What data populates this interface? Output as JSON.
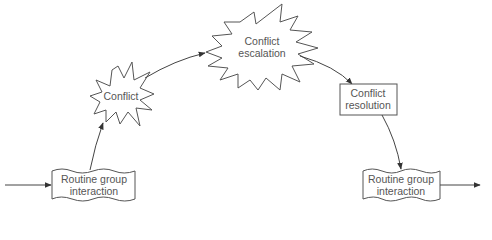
{
  "diagram": {
    "type": "cycle-flow",
    "colors": {
      "stroke": "#444444",
      "text": "#555555",
      "background": "#ffffff"
    },
    "nodes": [
      {
        "id": "routine-start",
        "shape": "wavy-box",
        "line1": "Routine group",
        "line2": "interaction"
      },
      {
        "id": "conflict",
        "shape": "small-starburst",
        "line1": "Conflict"
      },
      {
        "id": "escalation",
        "shape": "large-starburst",
        "line1": "Conflict",
        "line2": "escalation"
      },
      {
        "id": "resolution",
        "shape": "rectangle",
        "line1": "Conflict",
        "line2": "resolution"
      },
      {
        "id": "routine-end",
        "shape": "wavy-box",
        "line1": "Routine group",
        "line2": "interaction"
      }
    ],
    "edges": [
      {
        "from": "entry",
        "to": "routine-start"
      },
      {
        "from": "routine-start",
        "to": "conflict"
      },
      {
        "from": "conflict",
        "to": "escalation"
      },
      {
        "from": "escalation",
        "to": "resolution"
      },
      {
        "from": "resolution",
        "to": "routine-end"
      },
      {
        "from": "routine-end",
        "to": "exit"
      }
    ]
  }
}
